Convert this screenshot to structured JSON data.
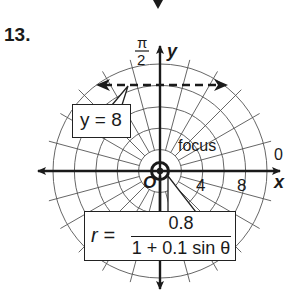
{
  "problem": {
    "number": "13."
  },
  "graph": {
    "type": "polar",
    "center_px": [
      160,
      171
    ],
    "ring_step_units": 2,
    "ring_count": 5,
    "radial_step_deg": 15,
    "axes": {
      "x_label": "x",
      "y_label": "y",
      "angle_zero_label": "0",
      "angle_top_numerator": "π",
      "angle_top_denominator": "2",
      "origin_label": "O"
    },
    "tick_labels": [
      "4",
      "8"
    ],
    "focus_label": "focus",
    "directrix": {
      "label": "y = 8",
      "y_value": 8,
      "style": "dashed"
    },
    "equation": {
      "lhs": "r =",
      "numerator": "0.8",
      "denominator": "1 + 0.1 sin θ"
    },
    "colors": {
      "line": "#1a1a1a",
      "grid": "#555555",
      "background": "#ffffff"
    }
  }
}
